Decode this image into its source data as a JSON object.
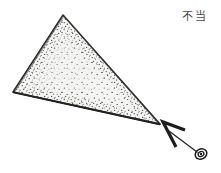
{
  "figure": {
    "kind": "hand-drawn-technical-illustration",
    "background_color": "#ffffff",
    "ink_color": "#2b2b2b",
    "stipple_color": "#3a3a3a",
    "fill_color": "#f4f4f2",
    "annotation_label": "不当",
    "annotation_label_color": "#4a4a4a",
    "shape": {
      "name": "stippled-triangle",
      "vertices": [
        {
          "name": "apex",
          "x": 63,
          "y": 15
        },
        {
          "name": "left",
          "x": 13,
          "y": 92
        },
        {
          "name": "right",
          "x": 160,
          "y": 124
        }
      ]
    },
    "pointer": {
      "name": "caret-arrowhead",
      "tip_x": 163,
      "tip_y": 122,
      "points": "176,147 163,122 185,130"
    },
    "leader_line": {
      "from_x": 169,
      "from_y": 131,
      "to_x": 197,
      "to_y": 152
    },
    "marker": {
      "name": "spiral-marker",
      "center_x": 201,
      "center_y": 154,
      "outer_rx": 6,
      "outer_ry": 5,
      "inner_rx": 3,
      "inner_ry": 2.4,
      "core_r": 1.2
    }
  }
}
